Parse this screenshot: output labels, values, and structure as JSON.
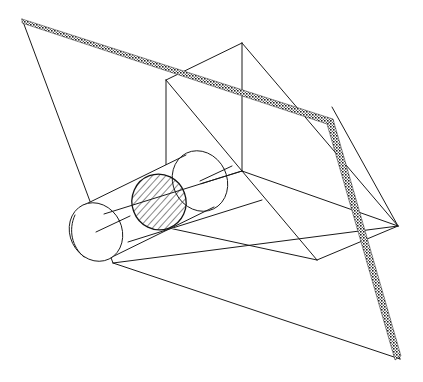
{
  "figure": {
    "kind": "line-drawing",
    "title": "Cylinder intersected by a plane, with a triangular prism cutting section",
    "background_color": "#ffffff",
    "line_color": "#1a1a1a",
    "hatch_color": "#111111",
    "canvas": {
      "width": 423,
      "height": 382
    },
    "labels": [],
    "elements": [
      {
        "name": "large-slanted-plane",
        "description": "large outer parallelogram plane drawn in thin outline"
      },
      {
        "name": "secondary-plane",
        "description": "second plane drawn with a thick hatched/shaded edge crossing the figure"
      },
      {
        "name": "triangular-prism",
        "description": "upright wedge/prism wireframe sitting on the large plane"
      },
      {
        "name": "cylinder",
        "description": "oblique cylinder passing through the prism"
      },
      {
        "name": "cross-section",
        "description": "hatched elliptical cross-section where the plane cuts the cylinder"
      }
    ],
    "geometry": {
      "outer_plane": [
        [
          22,
          19
        ],
        [
          332,
          107
        ],
        [
          398,
          226
        ],
        [
          113,
          263
        ]
      ],
      "shaded_edge": [
        [
          22,
          19
        ],
        [
          333,
          122
        ],
        [
          400,
          359
        ]
      ],
      "second_plane": [
        [
          22,
          19
        ],
        [
          333,
          122
        ],
        [
          400,
          359
        ],
        [
          113,
          263
        ]
      ],
      "prism_apex": [
        242,
        43
      ],
      "prism_left_top": [
        166,
        80
      ],
      "prism_left_bottom": [
        166,
        171
      ],
      "prism_center_vertical_top": [
        242,
        43
      ],
      "prism_center_vertical_bottom": [
        242,
        171
      ],
      "prism_right_tip": [
        398,
        226
      ],
      "prism_base_front": [
        317,
        260
      ],
      "prism_base_left": [
        104,
        214
      ],
      "cylinder_axis_start": [
        96,
        232
      ],
      "cylinder_axis_end": [
        200,
        181
      ],
      "cylinder_radius_x": 27,
      "cylinder_radius_y": 30,
      "cylinder_tilt_deg": -26,
      "section_center": [
        159,
        202
      ],
      "section_rx": 27,
      "section_ry": 28,
      "hatch_spacing_px": 5,
      "hatch_angle_deg": 62
    }
  }
}
